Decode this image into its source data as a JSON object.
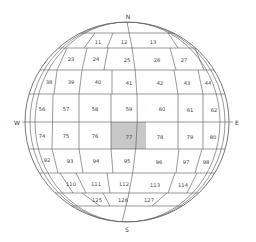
{
  "diagram": {
    "type": "spherical grid with numbered cells",
    "highlight_color": "#c8c8c8",
    "line_color": "#555555",
    "directions": {
      "north": "N",
      "south": "S",
      "west": "W",
      "east": "E"
    },
    "highlighted_cell": "77",
    "rows": [
      {
        "cells": [
          "11",
          "12",
          "13"
        ]
      },
      {
        "cells": [
          "23",
          "24",
          "25",
          "26",
          "27"
        ]
      },
      {
        "cells": [
          "38",
          "39",
          "40",
          "41",
          "42",
          "43",
          "44"
        ]
      },
      {
        "cells": [
          "56",
          "57",
          "58",
          "59",
          "60",
          "61",
          "62"
        ]
      },
      {
        "cells": [
          "74",
          "75",
          "76",
          "77",
          "78",
          "79",
          "80"
        ]
      },
      {
        "cells": [
          "92",
          "93",
          "94",
          "95",
          "96",
          "97",
          "98"
        ]
      },
      {
        "cells": [
          "110",
          "111",
          "112",
          "113",
          "114"
        ]
      },
      {
        "cells": [
          "125",
          "126",
          "127"
        ]
      }
    ]
  }
}
